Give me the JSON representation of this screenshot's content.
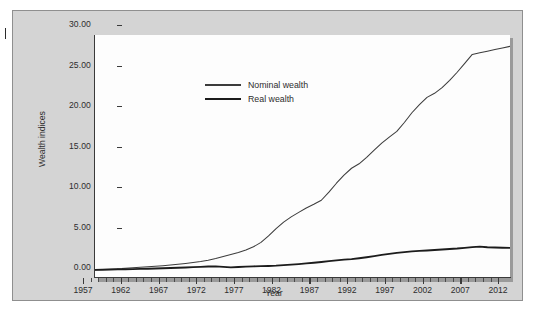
{
  "figure": {
    "background_color": "#d4d4d4",
    "plot_background_color": "#fdfdfd",
    "margin_mark": "page-edge-tick"
  },
  "chart_data": {
    "type": "line",
    "title": "",
    "xlabel": "Year",
    "ylabel": "Wealth indices",
    "xlim": [
      1957,
      2012
    ],
    "ylim": [
      0.0,
      30.0
    ],
    "grid": false,
    "legend_position": "upper-left-inside",
    "x_tick_labels": [
      "1957",
      "1962",
      "1967",
      "1972",
      "1977",
      "1982",
      "1987",
      "1992",
      "1997",
      "2002",
      "2007",
      "2012"
    ],
    "x_ticks": [
      1957,
      1962,
      1967,
      1972,
      1977,
      1982,
      1987,
      1992,
      1997,
      2002,
      2007,
      2012
    ],
    "x_minor_tick_interval": 1,
    "y_tick_labels": [
      "0.00",
      "5.00",
      "10.00",
      "15.00",
      "20.00",
      "25.00",
      "30.00"
    ],
    "y_ticks": [
      0,
      5,
      10,
      15,
      20,
      25,
      30
    ],
    "x": [
      1957,
      1958,
      1959,
      1960,
      1961,
      1962,
      1963,
      1964,
      1965,
      1966,
      1967,
      1968,
      1969,
      1970,
      1971,
      1972,
      1973,
      1974,
      1975,
      1976,
      1977,
      1978,
      1979,
      1980,
      1981,
      1982,
      1983,
      1984,
      1985,
      1986,
      1987,
      1988,
      1989,
      1990,
      1991,
      1992,
      1993,
      1994,
      1995,
      1996,
      1997,
      1998,
      1999,
      2000,
      2001,
      2002,
      2003,
      2004,
      2005,
      2006,
      2007,
      2008,
      2009,
      2010,
      2011,
      2012
    ],
    "series": [
      {
        "name": "Nominal wealth",
        "line_style": "thin",
        "color": "#3c3c3c",
        "values": [
          1.0,
          1.05,
          1.1,
          1.15,
          1.2,
          1.26,
          1.32,
          1.38,
          1.45,
          1.52,
          1.6,
          1.7,
          1.8,
          1.92,
          2.05,
          2.2,
          2.4,
          2.65,
          2.9,
          3.15,
          3.45,
          3.85,
          4.4,
          5.2,
          6.1,
          6.9,
          7.55,
          8.1,
          8.65,
          9.1,
          9.6,
          10.6,
          11.7,
          12.7,
          13.55,
          14.1,
          14.9,
          15.8,
          16.65,
          17.4,
          18.1,
          19.2,
          20.4,
          21.4,
          22.3,
          22.8,
          23.5,
          24.4,
          25.4,
          26.5,
          27.6,
          27.8,
          28.0,
          28.2,
          28.4,
          28.6
        ]
      },
      {
        "name": "Real wealth",
        "line_style": "thick",
        "color": "#1c1c1c",
        "values": [
          1.0,
          1.02,
          1.04,
          1.06,
          1.08,
          1.1,
          1.12,
          1.14,
          1.17,
          1.2,
          1.23,
          1.27,
          1.3,
          1.34,
          1.38,
          1.42,
          1.44,
          1.38,
          1.32,
          1.36,
          1.4,
          1.44,
          1.46,
          1.48,
          1.52,
          1.58,
          1.65,
          1.72,
          1.8,
          1.88,
          1.98,
          2.08,
          2.18,
          2.26,
          2.34,
          2.44,
          2.56,
          2.7,
          2.85,
          2.98,
          3.1,
          3.2,
          3.28,
          3.34,
          3.4,
          3.46,
          3.52,
          3.58,
          3.64,
          3.72,
          3.82,
          3.88,
          3.8,
          3.76,
          3.74,
          3.72
        ]
      }
    ]
  },
  "legend": {
    "items": [
      {
        "label": "Nominal wealth",
        "style": "thin"
      },
      {
        "label": "Real wealth",
        "style": "thick"
      }
    ]
  },
  "axis_titles": {
    "x": "Year",
    "y": "Wealth indices"
  }
}
